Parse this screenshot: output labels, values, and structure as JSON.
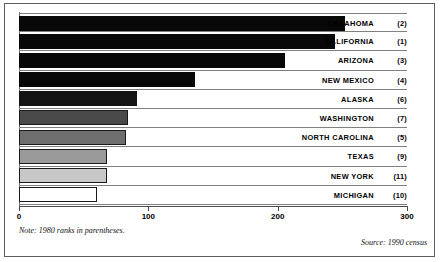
{
  "chart_data": {
    "type": "bar",
    "orientation": "horizontal",
    "title": "",
    "xlabel": "",
    "ylabel": "",
    "xlim": [
      0,
      300
    ],
    "xticks": [
      0,
      100,
      200,
      300
    ],
    "xtick_labels": [
      "0",
      "100",
      "200",
      "300"
    ],
    "grid": false,
    "legend": false,
    "categories": [
      "OKLAHOMA",
      "CALIFORNIA",
      "ARIZONA",
      "NEW MEXICO",
      "ALASKA",
      "WASHINGTON",
      "NORTH CAROLINA",
      "TEXAS",
      "NEW YORK",
      "MICHIGAN"
    ],
    "values": [
      252,
      244,
      206,
      136,
      91,
      84,
      83,
      68,
      68,
      60
    ],
    "annotations": [
      "(2)",
      "(1)",
      "(3)",
      "(4)",
      "(6)",
      "(7)",
      "(5)",
      "(9)",
      "(11)",
      "(10)"
    ],
    "bar_colors": [
      "#080808",
      "#080808",
      "#080808",
      "#080808",
      "#141414",
      "#4a4a4a",
      "#6e6e6e",
      "#9a9a9a",
      "#c8c8c8",
      "#ffffff"
    ],
    "note": "Note: 1980 ranks in parentheses.",
    "source": "Source: 1990 census"
  },
  "rows": [
    {
      "label": "OKLAHOMA",
      "rank": "(2)",
      "value": 252,
      "color": "#080808",
      "outlined": false
    },
    {
      "label": "CALIFORNIA",
      "rank": "(1)",
      "value": 244,
      "color": "#080808",
      "outlined": false
    },
    {
      "label": "ARIZONA",
      "rank": "(3)",
      "value": 206,
      "color": "#080808",
      "outlined": false
    },
    {
      "label": "NEW MEXICO",
      "rank": "(4)",
      "value": 136,
      "color": "#080808",
      "outlined": false
    },
    {
      "label": "ALASKA",
      "rank": "(6)",
      "value": 91,
      "color": "#141414",
      "outlined": false
    },
    {
      "label": "WASHINGTON",
      "rank": "(7)",
      "value": 84,
      "color": "#4a4a4a",
      "outlined": true
    },
    {
      "label": "NORTH CAROLINA",
      "rank": "(5)",
      "value": 83,
      "color": "#6e6e6e",
      "outlined": true
    },
    {
      "label": "TEXAS",
      "rank": "(9)",
      "value": 68,
      "color": "#9a9a9a",
      "outlined": true
    },
    {
      "label": "NEW YORK",
      "rank": "(11)",
      "value": 68,
      "color": "#c8c8c8",
      "outlined": true
    },
    {
      "label": "MICHIGAN",
      "rank": "(10)",
      "value": 60,
      "color": "#ffffff",
      "outlined": true
    }
  ],
  "axis": {
    "ticks": [
      {
        "value": 0,
        "label": "0"
      },
      {
        "value": 100,
        "label": "100"
      },
      {
        "value": 200,
        "label": "200"
      },
      {
        "value": 300,
        "label": "300"
      }
    ]
  },
  "footer": {
    "note": "Note: 1980 ranks in parentheses.",
    "source": "Source: 1990 census"
  }
}
